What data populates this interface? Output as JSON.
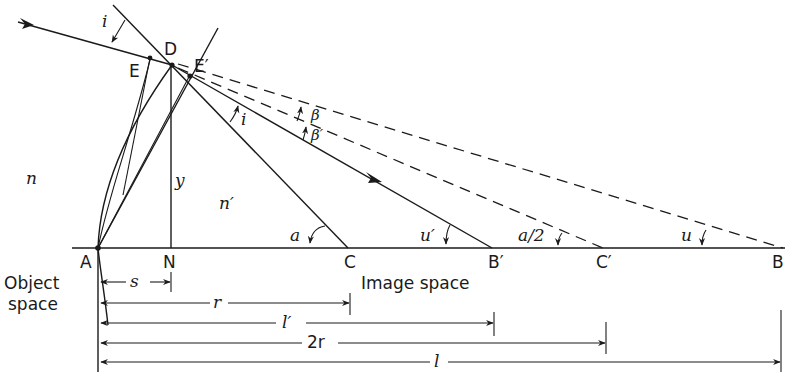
{
  "figure": {
    "type": "refraction at a spherical surface",
    "points": {
      "A": "A",
      "N": "N",
      "C": "C",
      "B_prime": "B′",
      "C_prime": "C′",
      "B": "B",
      "D": "D",
      "E": "E",
      "E_prime": "E′"
    },
    "media": {
      "n": "n",
      "n_prime": "n′"
    },
    "angles": {
      "i_incident": "i",
      "i_refracted": "i",
      "beta": "β",
      "beta_prime": "β′",
      "a": "a",
      "u_prime": "u′",
      "a_half": "a/2",
      "u": "u"
    },
    "lengths": {
      "y": "y",
      "s": "s",
      "r": "r",
      "l_prime": "l′",
      "two_r": "2r",
      "l": "l"
    },
    "regions": {
      "object_space_line1": "Object",
      "object_space_line2": "space",
      "image_space": "Image space"
    }
  }
}
